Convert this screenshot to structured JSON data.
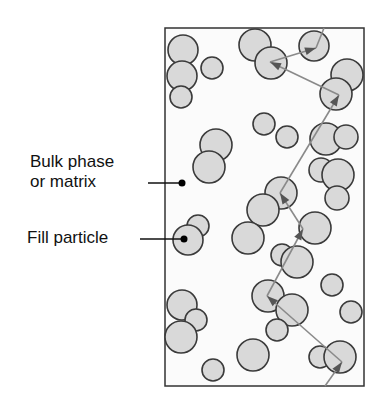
{
  "labels": {
    "bulk_line1": "Bulk phase",
    "bulk_line2": "or matrix",
    "fill": "Fill particle"
  },
  "colors": {
    "particle_fill": "#d9d9d9",
    "particle_stroke": "#3a3a3a",
    "box_stroke": "#333333",
    "path_stroke": "#8a8a8a",
    "arrowhead": "#555555",
    "background": "#ffffff",
    "matrix": "#fbfbfb"
  },
  "box": {
    "x": 165,
    "y": 28,
    "w": 199,
    "h": 358
  },
  "particles": [
    {
      "cx": 183,
      "cy": 50,
      "r": 15
    },
    {
      "cx": 182,
      "cy": 76,
      "r": 15
    },
    {
      "cx": 181,
      "cy": 97,
      "r": 11
    },
    {
      "cx": 212,
      "cy": 68,
      "r": 11
    },
    {
      "cx": 255,
      "cy": 45,
      "r": 16
    },
    {
      "cx": 271,
      "cy": 63,
      "r": 16
    },
    {
      "cx": 314,
      "cy": 46,
      "r": 15
    },
    {
      "cx": 347,
      "cy": 75,
      "r": 16
    },
    {
      "cx": 336,
      "cy": 94,
      "r": 16
    },
    {
      "cx": 264,
      "cy": 124,
      "r": 11
    },
    {
      "cx": 287,
      "cy": 137,
      "r": 11
    },
    {
      "cx": 216,
      "cy": 145,
      "r": 16
    },
    {
      "cx": 209,
      "cy": 167,
      "r": 16
    },
    {
      "cx": 326,
      "cy": 139,
      "r": 16
    },
    {
      "cx": 346,
      "cy": 137,
      "r": 12
    },
    {
      "cx": 321,
      "cy": 170,
      "r": 12
    },
    {
      "cx": 338,
      "cy": 175,
      "r": 16
    },
    {
      "cx": 337,
      "cy": 198,
      "r": 12
    },
    {
      "cx": 281,
      "cy": 193,
      "r": 16
    },
    {
      "cx": 263,
      "cy": 210,
      "r": 16
    },
    {
      "cx": 198,
      "cy": 226,
      "r": 11
    },
    {
      "cx": 188,
      "cy": 240,
      "r": 15
    },
    {
      "cx": 248,
      "cy": 238,
      "r": 16
    },
    {
      "cx": 315,
      "cy": 228,
      "r": 16
    },
    {
      "cx": 282,
      "cy": 255,
      "r": 11
    },
    {
      "cx": 297,
      "cy": 262,
      "r": 16
    },
    {
      "cx": 332,
      "cy": 285,
      "r": 11
    },
    {
      "cx": 182,
      "cy": 305,
      "r": 15
    },
    {
      "cx": 196,
      "cy": 320,
      "r": 11
    },
    {
      "cx": 181,
      "cy": 337,
      "r": 16
    },
    {
      "cx": 268,
      "cy": 296,
      "r": 16
    },
    {
      "cx": 292,
      "cy": 310,
      "r": 16
    },
    {
      "cx": 277,
      "cy": 330,
      "r": 11
    },
    {
      "cx": 351,
      "cy": 312,
      "r": 11
    },
    {
      "cx": 253,
      "cy": 355,
      "r": 16
    },
    {
      "cx": 213,
      "cy": 370,
      "r": 11
    },
    {
      "cx": 320,
      "cy": 357,
      "r": 11
    },
    {
      "cx": 340,
      "cy": 357,
      "r": 16
    }
  ],
  "path_points": [
    [
      325,
      386
    ],
    [
      342,
      362
    ],
    [
      267,
      296
    ],
    [
      303,
      229
    ],
    [
      280,
      193
    ],
    [
      339,
      95
    ],
    [
      270,
      62
    ],
    [
      316,
      48
    ],
    [
      324,
      28
    ]
  ],
  "leaders": [
    {
      "x1": 148,
      "y1": 183,
      "x2": 182,
      "y2": 183,
      "dot_r": 3.5
    },
    {
      "x1": 140,
      "y1": 239,
      "x2": 184,
      "y2": 239,
      "dot_r": 3.5
    }
  ]
}
